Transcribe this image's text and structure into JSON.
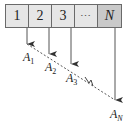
{
  "diagram": {
    "cells": [
      {
        "label": "1"
      },
      {
        "label": "2"
      },
      {
        "label": "3"
      },
      {
        "label": "⋯"
      },
      {
        "label": "N"
      }
    ],
    "nodes": [
      {
        "letter": "A",
        "sub": "1"
      },
      {
        "letter": "A",
        "sub": "2"
      },
      {
        "letter": "A",
        "sub": "3"
      },
      {
        "letter": "A",
        "sub": "N"
      }
    ],
    "colors": {
      "cell_fill": "#e6e6e6",
      "last_cell_fill": "#c9c9c9",
      "stroke": "#444444"
    }
  }
}
